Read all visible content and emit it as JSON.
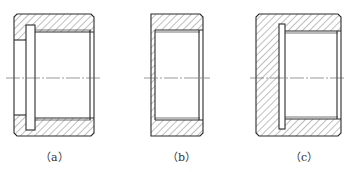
{
  "figures": [
    {
      "id": "a",
      "label": "（a）"
    },
    {
      "id": "b",
      "label": "（b）"
    },
    {
      "id": "c",
      "label": "（c）"
    }
  ],
  "colors": {
    "line": "#2a2a2a",
    "hatch": "#444444",
    "background": "#ffffff"
  }
}
